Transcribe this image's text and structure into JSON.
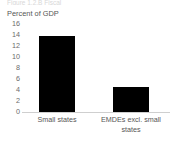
{
  "cropped_header_text": "Figure 1.2.B Fiscal",
  "chart_data": {
    "type": "bar",
    "title": "",
    "subtitle": "",
    "xlabel": "",
    "ylabel": "Percent of GDP",
    "ylim": [
      0,
      16
    ],
    "ytick_values": [
      16,
      14,
      12,
      10,
      8,
      6,
      4,
      2,
      0
    ],
    "ytick_labels": [
      "16",
      "14",
      "12",
      "10",
      "8",
      "6",
      "4",
      "2",
      "0"
    ],
    "grid": false,
    "legend": null,
    "legend_position": "none",
    "bar_color": "#000000",
    "axis_color": "#cfcfcf",
    "categories": [
      "Small states",
      "EMDEs excl. small states"
    ],
    "category_label_lines": [
      [
        "Small states"
      ],
      [
        "EMDEs excl. small",
        "states"
      ]
    ],
    "values": [
      13.9,
      4.6
    ],
    "series": [
      {
        "name": "Percent of GDP",
        "values": [
          13.9,
          4.6
        ]
      }
    ],
    "annotations": []
  }
}
